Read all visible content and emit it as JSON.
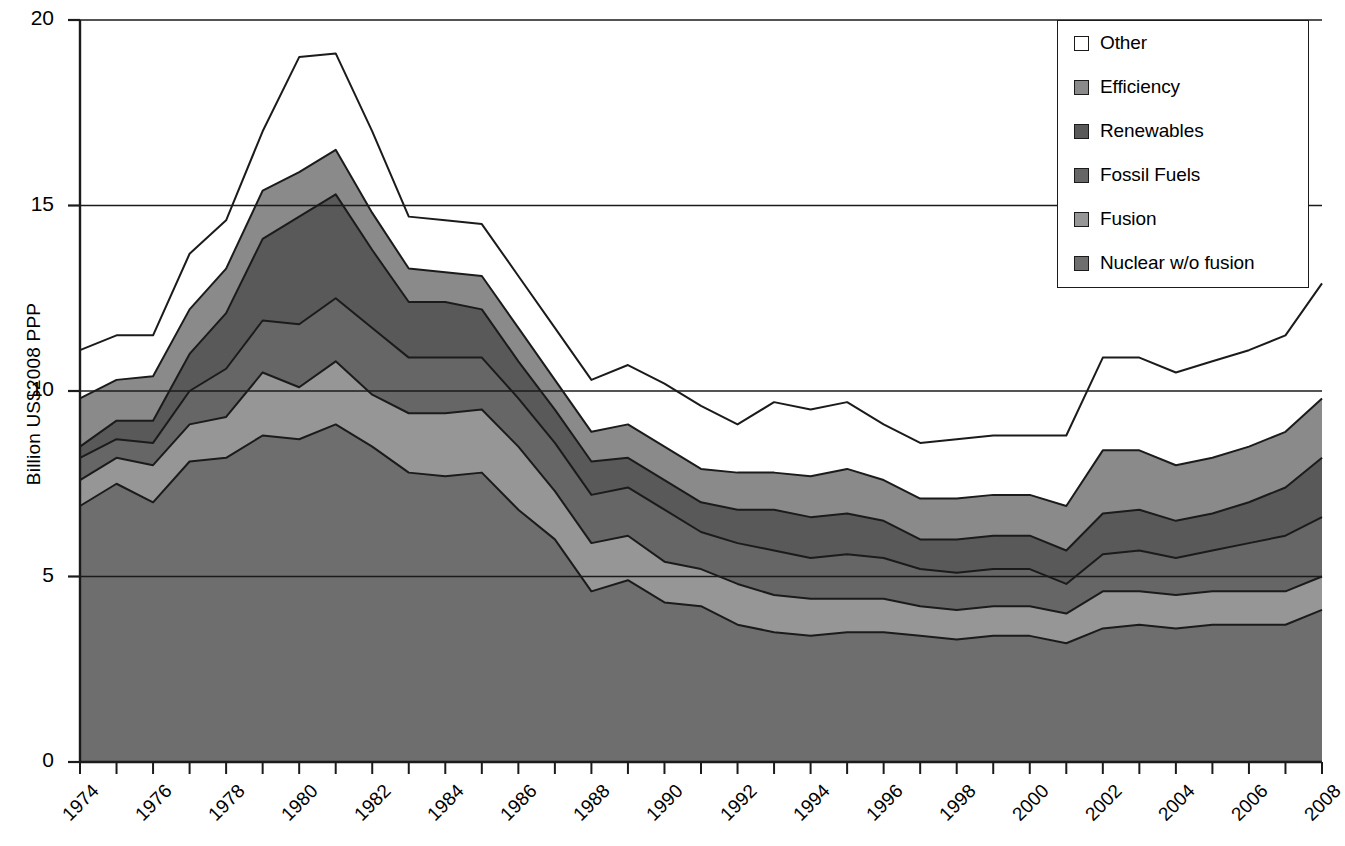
{
  "chart_data": {
    "type": "area",
    "stacked": true,
    "title": "",
    "xlabel": "",
    "ylabel": "Billion US$2008 PPP",
    "xlim": [
      1974,
      2008
    ],
    "ylim": [
      0,
      20
    ],
    "yticks": [
      0,
      5,
      10,
      15,
      20
    ],
    "ytick_labels": [
      "0",
      "5",
      "10",
      "15",
      "20"
    ],
    "grid": true,
    "grid_axis": "y",
    "legend_position": "top-right",
    "x": [
      1974,
      1975,
      1976,
      1977,
      1978,
      1979,
      1980,
      1981,
      1982,
      1983,
      1984,
      1985,
      1986,
      1987,
      1988,
      1989,
      1990,
      1991,
      1992,
      1993,
      1994,
      1995,
      1996,
      1997,
      1998,
      1999,
      2000,
      2001,
      2002,
      2003,
      2004,
      2005,
      2006,
      2007,
      2008
    ],
    "xtick_labels": [
      "1974",
      "1976",
      "1978",
      "1980",
      "1982",
      "1984",
      "1986",
      "1988",
      "1990",
      "1992",
      "1994",
      "1996",
      "1998",
      "2000",
      "2002",
      "2004",
      "2006",
      "2008"
    ],
    "series": [
      {
        "name": "Nuclear w/o fusion",
        "color": "#6e6e6e",
        "values": [
          6.9,
          7.5,
          7.0,
          8.1,
          8.2,
          8.8,
          8.7,
          9.1,
          8.5,
          7.8,
          7.7,
          7.8,
          6.8,
          6.0,
          4.6,
          4.9,
          4.3,
          4.2,
          3.7,
          3.5,
          3.4,
          3.5,
          3.5,
          3.4,
          3.3,
          3.4,
          3.4,
          3.2,
          3.6,
          3.7,
          3.6,
          3.7,
          3.7,
          3.7,
          4.1
        ]
      },
      {
        "name": "Fusion",
        "color": "#969696",
        "values": [
          0.7,
          0.7,
          1.0,
          1.0,
          1.1,
          1.7,
          1.4,
          1.7,
          1.4,
          1.6,
          1.7,
          1.7,
          1.7,
          1.3,
          1.3,
          1.2,
          1.1,
          1.0,
          1.1,
          1.0,
          1.0,
          0.9,
          0.9,
          0.8,
          0.8,
          0.8,
          0.8,
          0.8,
          1.0,
          0.9,
          0.9,
          0.9,
          0.9,
          0.9,
          0.9
        ]
      },
      {
        "name": "Fossil Fuels",
        "color": "#666666",
        "values": [
          0.6,
          0.5,
          0.6,
          0.9,
          1.3,
          1.4,
          1.7,
          1.7,
          1.8,
          1.5,
          1.5,
          1.4,
          1.3,
          1.3,
          1.3,
          1.3,
          1.4,
          1.0,
          1.1,
          1.2,
          1.1,
          1.2,
          1.1,
          1.0,
          1.0,
          1.0,
          1.0,
          0.8,
          1.0,
          1.1,
          1.0,
          1.1,
          1.3,
          1.5,
          1.6
        ]
      },
      {
        "name": "Renewables",
        "color": "#595959",
        "values": [
          0.3,
          0.5,
          0.6,
          1.0,
          1.5,
          2.2,
          2.9,
          2.8,
          2.1,
          1.5,
          1.5,
          1.3,
          1.0,
          0.9,
          0.9,
          0.8,
          0.8,
          0.8,
          0.9,
          1.1,
          1.1,
          1.1,
          1.0,
          0.8,
          0.9,
          0.9,
          0.9,
          0.9,
          1.1,
          1.1,
          1.0,
          1.0,
          1.1,
          1.3,
          1.6
        ]
      },
      {
        "name": "Efficiency",
        "color": "#8a8a8a",
        "values": [
          1.3,
          1.1,
          1.2,
          1.2,
          1.2,
          1.3,
          1.2,
          1.2,
          1.0,
          0.9,
          0.8,
          0.9,
          0.9,
          0.8,
          0.8,
          0.9,
          0.9,
          0.9,
          1.0,
          1.0,
          1.1,
          1.2,
          1.1,
          1.1,
          1.1,
          1.1,
          1.1,
          1.2,
          1.7,
          1.6,
          1.5,
          1.5,
          1.5,
          1.5,
          1.6
        ]
      },
      {
        "name": "Other",
        "color": "#ffffff",
        "values": [
          1.3,
          1.2,
          1.1,
          1.5,
          1.3,
          1.6,
          3.1,
          2.6,
          2.2,
          1.4,
          1.4,
          1.4,
          1.4,
          1.4,
          1.4,
          1.6,
          1.7,
          1.7,
          1.3,
          1.9,
          1.8,
          1.8,
          1.5,
          1.5,
          1.6,
          1.6,
          1.6,
          1.9,
          2.5,
          2.5,
          2.5,
          2.6,
          2.6,
          2.6,
          3.1
        ]
      }
    ],
    "legend_entries": [
      {
        "label": "Other",
        "color": "#ffffff"
      },
      {
        "label": "Efficiency",
        "color": "#8a8a8a"
      },
      {
        "label": "Renewables",
        "color": "#595959"
      },
      {
        "label": "Fossil Fuels",
        "color": "#666666"
      },
      {
        "label": "Fusion",
        "color": "#969696"
      },
      {
        "label": "Nuclear w/o fusion",
        "color": "#6e6e6e"
      }
    ],
    "legend_order_bottom_to_top": [
      "Nuclear w/o fusion",
      "Fusion",
      "Fossil Fuels",
      "Renewables",
      "Efficiency",
      "Other"
    ],
    "totals": [
      10.2,
      11.5,
      11.5,
      13.7,
      14.6,
      17.0,
      19.0,
      19.1,
      17.0,
      14.7,
      14.6,
      14.5,
      13.1,
      11.7,
      10.3,
      10.7,
      10.2,
      9.6,
      9.1,
      9.7,
      9.5,
      9.7,
      9.1,
      8.6,
      8.7,
      8.8,
      8.8,
      8.8,
      10.9,
      10.9,
      10.5,
      10.8,
      11.1,
      11.5,
      12.9
    ]
  },
  "axis": {
    "y_title": "Billion US$2008 PPP"
  }
}
